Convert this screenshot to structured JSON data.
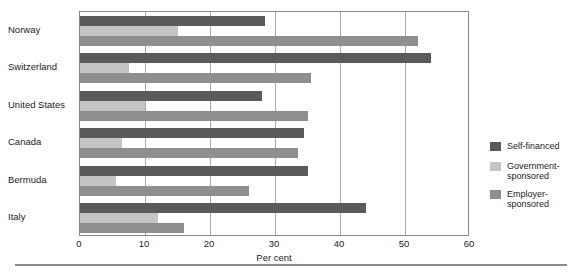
{
  "chart_data": {
    "type": "bar",
    "orientation": "horizontal",
    "title": "",
    "xlabel": "Per cent",
    "ylabel": "",
    "xlim": [
      0,
      60
    ],
    "xticks": [
      0,
      10,
      20,
      30,
      40,
      50,
      60
    ],
    "grid": true,
    "legend_position": "right",
    "categories": [
      "Norway",
      "Switzerland",
      "United States",
      "Canada",
      "Bermuda",
      "Italy"
    ],
    "series": [
      {
        "name": "Self-financed",
        "color": "#5a5a5a",
        "values": [
          28.5,
          54,
          28,
          34.5,
          35,
          44
        ]
      },
      {
        "name": "Government-sponsored",
        "color": "#c4c4c4",
        "values": [
          15,
          7.5,
          10,
          6.5,
          5.5,
          12
        ]
      },
      {
        "name": "Employer-sponsored",
        "color": "#8e8e8e",
        "values": [
          52,
          35.5,
          35,
          33.5,
          26,
          16
        ]
      }
    ]
  },
  "legend": {
    "items": [
      {
        "label": "Self-financed",
        "color": "#5a5a5a"
      },
      {
        "label": "Government-sponsored",
        "color": "#c4c4c4"
      },
      {
        "label": "Employer-sponsored",
        "color": "#8e8e8e"
      }
    ]
  },
  "axis": {
    "x_title": "Per cent",
    "x_tick_labels": [
      "0",
      "10",
      "20",
      "30",
      "40",
      "50",
      "60"
    ],
    "y_tick_labels": [
      "Norway",
      "Switzerland",
      "United States",
      "Canada",
      "Bermuda",
      "Italy"
    ]
  }
}
